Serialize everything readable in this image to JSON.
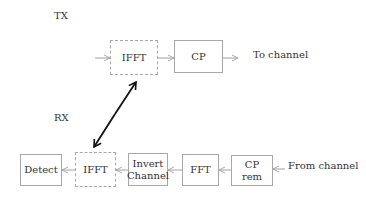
{
  "tx": {
    "label": "TX",
    "blocks": [
      {
        "id": "tx-ifft",
        "label": "IFFT",
        "style": "dashed"
      },
      {
        "id": "tx-cp",
        "label": "CP",
        "style": "solid"
      }
    ],
    "output_label": "To channel"
  },
  "rx": {
    "label": "RX",
    "blocks": [
      {
        "id": "rx-detect",
        "label": "Detect",
        "style": "solid"
      },
      {
        "id": "rx-ifft",
        "label": "IFFT",
        "style": "dashed"
      },
      {
        "id": "rx-invert-channel",
        "label_line1": "Invert",
        "label_line2": "Channel",
        "style": "solid"
      },
      {
        "id": "rx-fft",
        "label": "FFT",
        "style": "solid"
      },
      {
        "id": "rx-cp-rem",
        "label_line1": "CP",
        "label_line2": "rem",
        "style": "solid"
      }
    ],
    "input_label": "From channel"
  },
  "colors": {
    "box_border": "#a8a8a8",
    "flow_arrow": "#a0a0a0",
    "link_arrow": "#111111",
    "text": "#333333"
  }
}
